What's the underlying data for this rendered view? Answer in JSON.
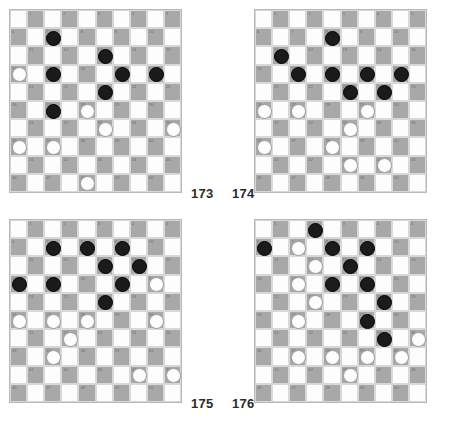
{
  "diagram": {
    "type": "draughts-puzzle-sheet",
    "board_size": 10,
    "numbered_squares": 50,
    "colors": {
      "dark_square": "#a8a8a8",
      "light_square": "#fdfdfd",
      "black_piece": "#1b1b1b",
      "white_piece": "#fdfdfd",
      "border": "#b8b8b8",
      "square_number": "#6e6e6e",
      "caption": "#2b2b2b"
    },
    "square_numbers": [
      1,
      2,
      3,
      4,
      5,
      6,
      7,
      8,
      9,
      10,
      11,
      12,
      13,
      14,
      15,
      16,
      17,
      18,
      19,
      20,
      21,
      22,
      23,
      24,
      25,
      26,
      27,
      28,
      29,
      30,
      31,
      32,
      33,
      34,
      35,
      36,
      37,
      38,
      39,
      40,
      41,
      42,
      43,
      44,
      45,
      46,
      47,
      48,
      49,
      50
    ],
    "boards": [
      {
        "id": "board-173",
        "caption": "173",
        "position": "top-left",
        "black_pieces": [
          7,
          13,
          17,
          19,
          20,
          23,
          27
        ],
        "white_pieces": [
          16,
          28,
          33,
          35,
          36,
          37,
          48
        ]
      },
      {
        "id": "board-174",
        "caption": "174",
        "position": "top-right",
        "black_pieces": [
          8,
          11,
          17,
          18,
          19,
          20,
          23,
          24
        ],
        "white_pieces": [
          26,
          27,
          29,
          33,
          36,
          38,
          43,
          44
        ]
      },
      {
        "id": "board-175",
        "caption": "175",
        "position": "bottom-left",
        "black_pieces": [
          7,
          8,
          9,
          13,
          14,
          16,
          17,
          19,
          23
        ],
        "white_pieces": [
          20,
          26,
          27,
          28,
          30,
          32,
          37,
          44,
          45
        ]
      },
      {
        "id": "board-176",
        "caption": "176",
        "position": "bottom-right",
        "black_pieces": [
          2,
          6,
          8,
          9,
          13,
          18,
          19,
          24,
          29,
          34
        ],
        "white_pieces": [
          7,
          12,
          17,
          22,
          27,
          35,
          37,
          38,
          39,
          40,
          43
        ]
      }
    ]
  }
}
